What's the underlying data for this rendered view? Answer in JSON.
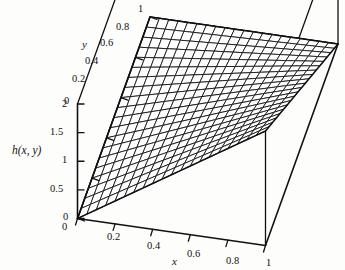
{
  "figure": {
    "kind": "surface-plot-3d",
    "background_color": "#fdfdfc",
    "line_color": "#111111",
    "surface_fill": "#ffffff"
  },
  "chart_data": {
    "type": "line",
    "plot_style": "3d-wireframe-surface",
    "title": "",
    "xlabel": "x",
    "ylabel": "y",
    "zlabel": "h(x, y)",
    "xlim": [
      0,
      1
    ],
    "ylim": [
      0,
      1
    ],
    "zlim": [
      0,
      2
    ],
    "xticks": [
      0,
      0.2,
      0.4,
      0.6,
      0.8,
      1
    ],
    "xtick_labels": [
      "0",
      "0.2",
      "0.4",
      "0.6",
      "0.8",
      "1"
    ],
    "yticks": [
      0,
      0.2,
      0.4,
      0.6,
      0.8,
      1
    ],
    "ytick_labels": [
      "0",
      "0.2",
      "0.4",
      "0.6",
      "0.8",
      "1"
    ],
    "zticks": [
      0,
      0.5,
      1,
      1.5,
      2
    ],
    "ztick_labels": [
      "0",
      "0.5",
      "1",
      "1.5",
      "2"
    ],
    "grid": false,
    "legend": null,
    "mesh_divisions": 20,
    "surface_formula": "h(x,y) = 2*x*(1-y)",
    "corner_values": [
      {
        "x": 0,
        "y": 0,
        "z": 0
      },
      {
        "x": 1,
        "y": 0,
        "z": 2
      },
      {
        "x": 0,
        "y": 1,
        "z": 0
      },
      {
        "x": 1,
        "y": 1,
        "z": 0
      }
    ]
  },
  "axes": {
    "x_title": "x",
    "y_title": "y",
    "z_title": "h(x, y)",
    "x_tick_labels": [
      "0",
      "0.2",
      "0.4",
      "0.6",
      "0.8",
      "1"
    ],
    "y_tick_labels": [
      "0",
      "0.2",
      "0.4",
      "0.6",
      "0.8",
      "1"
    ],
    "z_tick_labels": [
      "0",
      "0.5",
      "1",
      "1.5",
      "2"
    ]
  }
}
